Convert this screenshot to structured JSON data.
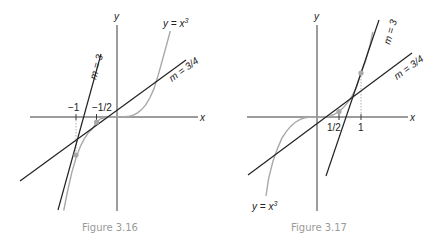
{
  "figures": [
    {
      "caption": "Figure 3.16",
      "axis_x_label": "x",
      "axis_y_label": "y",
      "curve_label": "y = x",
      "curve_exp": "3",
      "tangent_steep_label": "m = 3",
      "tangent_shallow_label": "m = 3/4",
      "ticks": [
        {
          "value": -1,
          "label": "−1"
        },
        {
          "value": -0.5,
          "label": "−1/2"
        }
      ],
      "tangent_points": [
        {
          "x": -1,
          "y": -1,
          "slope": 3
        },
        {
          "x": -0.5,
          "y": -0.125,
          "slope": 0.75
        }
      ]
    },
    {
      "caption": "Figure 3.17",
      "axis_x_label": "x",
      "axis_y_label": "y",
      "curve_label": "y = x",
      "curve_exp": "3",
      "tangent_steep_label": "m = 3",
      "tangent_shallow_label": "m = 3/4",
      "ticks": [
        {
          "value": 0.5,
          "label": "1/2"
        },
        {
          "value": 1,
          "label": "1"
        }
      ],
      "tangent_points": [
        {
          "x": 1,
          "y": 1,
          "slope": 3
        },
        {
          "x": 0.5,
          "y": 0.125,
          "slope": 0.75
        }
      ]
    }
  ],
  "colors": {
    "axis": "#3a3a3a",
    "tangent_line": "#222222",
    "curve": "#a8a8a8",
    "caption": "#9a9a9a"
  }
}
